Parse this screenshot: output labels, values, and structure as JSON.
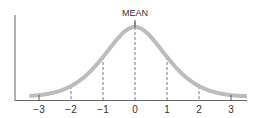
{
  "chart_data": {
    "type": "line",
    "title": "",
    "annotation": "MEAN",
    "xlabel": "",
    "ylabel": "",
    "x_ticks": [
      -3,
      -2,
      -1,
      0,
      1,
      2,
      3
    ],
    "x_tick_labels": [
      "−3",
      "−2",
      "−1",
      "0",
      "1",
      "2",
      "3"
    ],
    "xlim": [
      -3.3,
      3.5
    ],
    "grid": false,
    "legend": null,
    "series": [
      {
        "name": "bell curve",
        "x": [
          -3.3,
          -3,
          -2.5,
          -2,
          -1.5,
          -1,
          -0.5,
          0,
          0.5,
          1,
          1.5,
          2,
          2.5,
          3,
          3.5
        ],
        "values": [
          0.02,
          0.03,
          0.08,
          0.17,
          0.32,
          0.51,
          0.82,
          1.0,
          0.82,
          0.51,
          0.32,
          0.17,
          0.08,
          0.03,
          0.01
        ]
      }
    ],
    "dashed_verticals_at": [
      -2,
      -1,
      0,
      1,
      2
    ],
    "colors": {
      "curve": "#bdbdbd",
      "axis": "#555555",
      "dashes": "#555555"
    }
  }
}
